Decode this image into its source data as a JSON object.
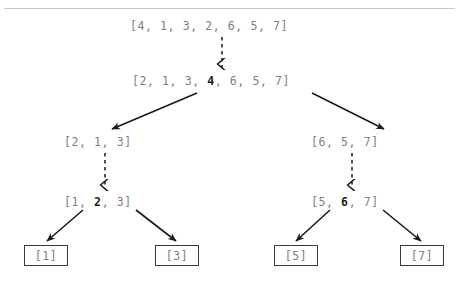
{
  "diagram": {
    "type": "recursion-tree",
    "background_color": "#ffffff",
    "text_color": "#808080",
    "pivot_color": "#1a1a1a",
    "arrow_color": "#1a1a1a",
    "rule_color": "#c9c9c9"
  },
  "levels": [
    {
      "level": 0,
      "nodes": [
        {
          "id": "root",
          "text": "[4, 1, 3, 2, 6, 5, 7]",
          "pre": "[4, 1, 3, 2, 6, 5, 7]",
          "pivot": "",
          "post": "",
          "boxed": false,
          "x": 130,
          "y": 19
        }
      ]
    },
    {
      "level": 1,
      "nodes": [
        {
          "id": "partitioned-root",
          "text": "[2, 1, 3, 4, 6, 5, 7]",
          "pre": "[2, 1, 3, ",
          "pivot": "4",
          "post": ", 6, 5, 7]",
          "boxed": false,
          "x": 132,
          "y": 74
        }
      ]
    },
    {
      "level": 2,
      "nodes": [
        {
          "id": "left-sub",
          "text": "[2, 1, 3]",
          "pre": "[2, 1, 3]",
          "pivot": "",
          "post": "",
          "boxed": false,
          "x": 64,
          "y": 135
        },
        {
          "id": "right-sub",
          "text": "[6, 5, 7]",
          "pre": "[6, 5, 7]",
          "pivot": "",
          "post": "",
          "boxed": false,
          "x": 311,
          "y": 135
        }
      ]
    },
    {
      "level": 3,
      "nodes": [
        {
          "id": "left-partitioned",
          "text": "[1, 2, 3]",
          "pre": "[1, ",
          "pivot": "2",
          "post": ", 3]",
          "boxed": false,
          "x": 64,
          "y": 195
        },
        {
          "id": "right-partitioned",
          "text": "[5, 6, 7]",
          "pre": "[5, ",
          "pivot": "6",
          "post": ", 7]",
          "boxed": false,
          "x": 311,
          "y": 195
        }
      ]
    },
    {
      "level": 4,
      "nodes": [
        {
          "id": "leaf-1",
          "text": "[1]",
          "boxed": true,
          "x": 24,
          "y": 245
        },
        {
          "id": "leaf-3",
          "text": "[3]",
          "boxed": true,
          "x": 155,
          "y": 245
        },
        {
          "id": "leaf-5",
          "text": "[5]",
          "boxed": true,
          "x": 274,
          "y": 245
        },
        {
          "id": "leaf-7",
          "text": "[7]",
          "boxed": true,
          "x": 400,
          "y": 245
        }
      ]
    }
  ],
  "edges": [
    {
      "id": "edge-root-partition",
      "style": "dashed",
      "from": "root",
      "to": "partitioned-root",
      "x1": 222,
      "y1": 37,
      "x2": 222,
      "y2": 68
    },
    {
      "id": "edge-partition-left",
      "style": "solid",
      "from": "partitioned-root",
      "to": "left-sub",
      "x1": 197,
      "y1": 93,
      "x2": 112,
      "y2": 129
    },
    {
      "id": "edge-partition-right",
      "style": "solid",
      "from": "partitioned-root",
      "to": "right-sub",
      "x1": 312,
      "y1": 93,
      "x2": 384,
      "y2": 129
    },
    {
      "id": "edge-left-sub-partition",
      "style": "dashed",
      "from": "left-sub",
      "to": "left-partitioned",
      "x1": 105,
      "y1": 153,
      "x2": 105,
      "y2": 189
    },
    {
      "id": "edge-right-sub-partition",
      "style": "dashed",
      "from": "right-sub",
      "to": "right-partitioned",
      "x1": 352,
      "y1": 153,
      "x2": 352,
      "y2": 189
    },
    {
      "id": "edge-left-to-leaf-1",
      "style": "solid",
      "from": "left-partitioned",
      "to": "leaf-1",
      "x1": 83,
      "y1": 210,
      "x2": 47,
      "y2": 241
    },
    {
      "id": "edge-left-to-leaf-3",
      "style": "solid",
      "from": "left-partitioned",
      "to": "leaf-3",
      "x1": 136,
      "y1": 210,
      "x2": 176,
      "y2": 241
    },
    {
      "id": "edge-right-to-leaf-5",
      "style": "solid",
      "from": "right-partitioned",
      "to": "leaf-5",
      "x1": 330,
      "y1": 210,
      "x2": 296,
      "y2": 241
    },
    {
      "id": "edge-right-to-leaf-7",
      "style": "solid",
      "from": "right-partitioned",
      "to": "leaf-7",
      "x1": 383,
      "y1": 210,
      "x2": 421,
      "y2": 241
    }
  ]
}
